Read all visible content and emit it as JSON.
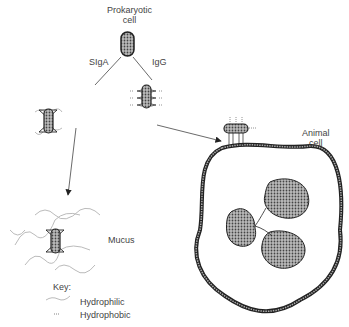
{
  "labels": {
    "prokaryotic_line1": "Prokaryotic",
    "prokaryotic_line2": "cell",
    "siga": "SIgA",
    "igg": "IgG",
    "animal_line1": "Animal",
    "animal_line2": "cell",
    "mucus": "Mucus"
  },
  "key": {
    "title": "Key:",
    "items": [
      {
        "symbol": "hydrophilic-squiggle",
        "label": "Hydrophilic"
      },
      {
        "symbol": "hydrophobic-dots",
        "label": "Hydrophobic"
      }
    ]
  },
  "colors": {
    "line": "#222222",
    "fill": "#8a8a8a",
    "hydrophilic": "#bbbbbb"
  }
}
